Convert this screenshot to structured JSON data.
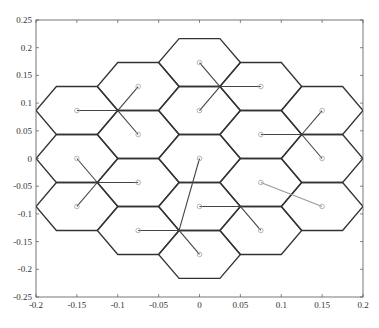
{
  "chart_data": {
    "type": "scatter",
    "title": "",
    "xlabel": "",
    "ylabel": "",
    "xlim": [
      -0.2,
      0.2
    ],
    "ylim": [
      -0.25,
      0.25
    ],
    "xticks": [
      "-0.2",
      "-0.15",
      "-0.1",
      "-0.05",
      "0",
      "0.05",
      "0.1",
      "0.15",
      "0.2"
    ],
    "yticks": [
      "0.25",
      "0.2",
      "0.15",
      "0.1",
      "0.05",
      "0",
      "-0.05",
      "-0.1",
      "-0.15",
      "-0.2",
      "-0.25"
    ],
    "grid": false,
    "hex_radius": 0.05,
    "cell_centers": [
      [
        -0.15,
        0.0866
      ],
      [
        -0.15,
        0
      ],
      [
        -0.15,
        -0.0866
      ],
      [
        -0.075,
        0.1299
      ],
      [
        -0.075,
        0.0433
      ],
      [
        -0.075,
        -0.0433
      ],
      [
        -0.075,
        -0.1299
      ],
      [
        0,
        0.1732
      ],
      [
        0,
        0.0866
      ],
      [
        0,
        0
      ],
      [
        0,
        -0.0866
      ],
      [
        0,
        -0.1732
      ],
      [
        0.075,
        0.1299
      ],
      [
        0.075,
        0.0433
      ],
      [
        0.075,
        -0.0433
      ],
      [
        0.075,
        -0.1299
      ],
      [
        0.15,
        0.0866
      ],
      [
        0.15,
        0
      ],
      [
        0.15,
        -0.0866
      ]
    ],
    "links": [
      {
        "from": [
          -0.15,
          0.0866
        ],
        "to": [
          -0.1,
          0.0866
        ],
        "color": "#444"
      },
      {
        "from": [
          -0.075,
          0.1299
        ],
        "to": [
          -0.1,
          0.0866
        ],
        "color": "#444"
      },
      {
        "from": [
          -0.075,
          0.0433
        ],
        "to": [
          -0.1,
          0.0866
        ],
        "color": "#444"
      },
      {
        "from": [
          0,
          0.1732
        ],
        "to": [
          0.025,
          0.1299
        ],
        "color": "#444"
      },
      {
        "from": [
          0,
          0.0866
        ],
        "to": [
          0.025,
          0.1299
        ],
        "color": "#444"
      },
      {
        "from": [
          0.075,
          0.1299
        ],
        "to": [
          0.025,
          0.1299
        ],
        "color": "#444"
      },
      {
        "from": [
          0.075,
          0.0433
        ],
        "to": [
          0.125,
          0.0433
        ],
        "color": "#444"
      },
      {
        "from": [
          0.15,
          0.0866
        ],
        "to": [
          0.125,
          0.0433
        ],
        "color": "#444"
      },
      {
        "from": [
          0.15,
          0
        ],
        "to": [
          0.125,
          0.0433
        ],
        "color": "#444"
      },
      {
        "from": [
          -0.15,
          0
        ],
        "to": [
          -0.125,
          -0.0433
        ],
        "color": "#444"
      },
      {
        "from": [
          -0.075,
          -0.0433
        ],
        "to": [
          -0.125,
          -0.0433
        ],
        "color": "#444"
      },
      {
        "from": [
          -0.15,
          -0.0866
        ],
        "to": [
          -0.125,
          -0.0433
        ],
        "color": "#444"
      },
      {
        "from": [
          0,
          0
        ],
        "to": [
          -0.025,
          -0.1299
        ],
        "color": "#444"
      },
      {
        "from": [
          -0.075,
          -0.1299
        ],
        "to": [
          -0.025,
          -0.1299
        ],
        "color": "#444"
      },
      {
        "from": [
          0,
          -0.1732
        ],
        "to": [
          -0.025,
          -0.1299
        ],
        "color": "#444"
      },
      {
        "from": [
          0,
          -0.0866
        ],
        "to": [
          0.05,
          -0.0866
        ],
        "color": "#444"
      },
      {
        "from": [
          0.075,
          -0.1299
        ],
        "to": [
          0.05,
          -0.0866
        ],
        "color": "#444"
      },
      {
        "from": [
          0.075,
          -0.0433
        ],
        "to": [
          0.15,
          -0.0866
        ],
        "color": "#999"
      }
    ]
  }
}
